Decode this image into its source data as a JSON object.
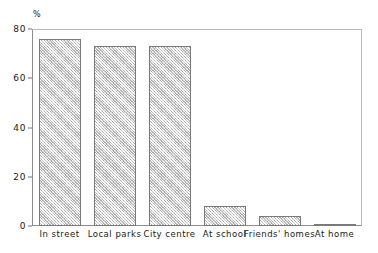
{
  "chart_data": {
    "type": "bar",
    "title": "",
    "subtitle": "",
    "xlabel": "",
    "ylabel": "%",
    "unit_label": "%",
    "ylim": [
      0,
      80
    ],
    "yticks": [
      0,
      20,
      40,
      60,
      80
    ],
    "ytick_labels": [
      "0",
      "20",
      "40",
      "60",
      "80"
    ],
    "grid": false,
    "legend": null,
    "categories": [
      "In street",
      "Local parks",
      "City centre",
      "At school",
      "Friends' homes",
      "At home"
    ],
    "values": [
      76,
      73,
      73,
      8,
      4,
      1
    ],
    "series": [
      {
        "name": "",
        "values": [
          76,
          73,
          73,
          8,
          4,
          1
        ]
      }
    ],
    "annotations": []
  },
  "style": {
    "bar_fill": "#d2d2d2",
    "bar_edge": "#7a7a7a",
    "axis_color": "#8d8d8d",
    "text_color": "#1a1a1a",
    "background": "#ffffff"
  }
}
